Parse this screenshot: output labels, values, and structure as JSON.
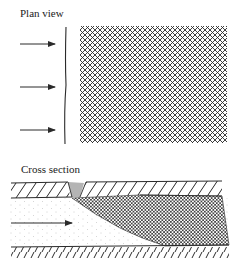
{
  "figure": {
    "plan_view": {
      "title": "Plan view",
      "arrows": 3,
      "arrow_y": [
        44,
        87,
        130
      ],
      "wall_x": 65,
      "hatched_region": {
        "x": 80,
        "y": 26,
        "width": 147,
        "height": 117,
        "pattern": "crosshatch"
      }
    },
    "cross_section": {
      "title": "Cross section",
      "arrows": 1,
      "arrow_y": 223,
      "layers": [
        "upper hatched wall",
        "flow channel (dotted)",
        "crosshatched deposit",
        "lower hatched wall"
      ]
    },
    "colors": {
      "ink": "#2a2a2a",
      "background": "#ffffff"
    }
  }
}
